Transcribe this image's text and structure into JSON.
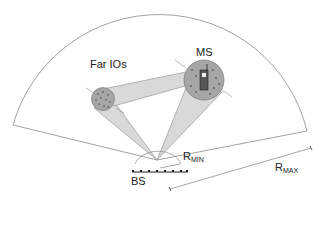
{
  "diagram": {
    "labels": {
      "far_ios": "Far IOs",
      "ms": "MS",
      "bs": "BS",
      "rmin_main": "R",
      "rmin_sub": "MIN",
      "rmax_main": "R",
      "rmax_sub": "MAX"
    },
    "colors": {
      "outline": "#8a8a8a",
      "beam_fill": "#d9d9d9",
      "cluster_fill": "#a6a6a6",
      "cluster_stroke": "#7a7a7a",
      "scatter_dot": "#333333",
      "text": "#222222"
    },
    "elements": [
      "sector-boundary",
      "base-station-array",
      "far-io-cluster",
      "mobile-station-cluster",
      "beam-to-far-io",
      "beam-to-ms",
      "beam-ms-to-far-io",
      "rmin-arrow",
      "rmax-arrow"
    ]
  }
}
